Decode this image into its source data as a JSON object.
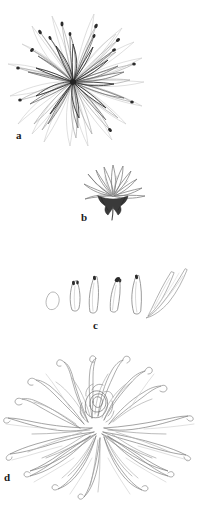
{
  "figure": {
    "background_color": "#ffffff",
    "width": 201,
    "height": 509,
    "medium": "pencil line drawing"
  },
  "ink": {
    "dark": "#2b2b2b",
    "mid": "#6e6e6e",
    "light": "#a8a8a8",
    "faint": "#c9c9c9",
    "receptacle_fill": "#3a3a3a",
    "label_color": "#1b1b1b"
  },
  "panels": [
    {
      "id": "a",
      "label": "a",
      "caption": "flat radial flower head viewed from above",
      "center": {
        "x": 73,
        "y": 80
      },
      "petal_rings": [
        {
          "name": "inner",
          "count": 9,
          "length": 30,
          "width": 9,
          "tone": "dark",
          "start_angle": 8
        },
        {
          "name": "middle",
          "count": 13,
          "length": 46,
          "width": 8,
          "tone": "mid",
          "start_angle": 14
        },
        {
          "name": "outer",
          "count": 17,
          "length": 62,
          "width": 7,
          "tone": "light",
          "start_angle": 0
        },
        {
          "name": "fringe",
          "count": 19,
          "length": 76,
          "width": 6,
          "tone": "faint",
          "start_angle": 9
        }
      ]
    },
    {
      "id": "b",
      "label": "b",
      "caption": "side view of flower head with dark receptacle and stem",
      "petal_count": 11,
      "fan_spread_degrees": 150,
      "has_receptacle": true,
      "has_stem": true
    },
    {
      "id": "c",
      "label": "c",
      "caption": "row of detached individual florets, shortest to longest",
      "specimens": [
        {
          "index": 1,
          "shape": "open oval disc floret",
          "length": 17,
          "width": 13,
          "tilt": -4,
          "tone": "light"
        },
        {
          "index": 2,
          "shape": "short closed petal with dark tip",
          "length": 26,
          "width": 7,
          "tilt": 2,
          "tone": "mid"
        },
        {
          "index": 3,
          "shape": "slender petal with dark tip",
          "length": 32,
          "width": 7,
          "tilt": -3,
          "tone": "mid"
        },
        {
          "index": 4,
          "shape": "slender petal with notched dark tip",
          "length": 30,
          "width": 7,
          "tilt": 6,
          "tone": "mid"
        },
        {
          "index": 5,
          "shape": "long tapering petal",
          "length": 34,
          "width": 7,
          "tilt": -2,
          "tone": "mid"
        },
        {
          "index": 6,
          "shape": "long curving strap floret",
          "length": 40,
          "width": 6,
          "tilt": 10,
          "tone": "light"
        },
        {
          "index": 7,
          "shape": "longest sweeping strap floret",
          "length": 46,
          "width": 6,
          "tilt": 18,
          "tone": "light"
        }
      ]
    },
    {
      "id": "d",
      "label": "d",
      "caption": "full spider chrysanthemum bloom with curling ray florets",
      "core": {
        "x": 95,
        "y": 68
      },
      "upright_petal_count": 14,
      "sweeping_petal_count": 22,
      "lower_petal_count": 16
    }
  ]
}
